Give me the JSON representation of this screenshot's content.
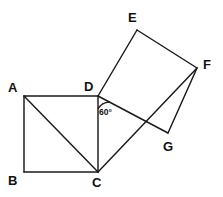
{
  "figure": {
    "name": "two-squares-geometry-diagram",
    "width": 223,
    "height": 197,
    "background_color": "#ffffff",
    "stroke_color": "#1a1a1a"
  },
  "vertices": [
    {
      "id": "A",
      "label": "A",
      "x": 24,
      "y": 96,
      "label_x": 8,
      "label_y": 81
    },
    {
      "id": "B",
      "label": "B",
      "x": 24,
      "y": 172,
      "label_x": 8,
      "label_y": 174
    },
    {
      "id": "C",
      "label": "C",
      "x": 98,
      "y": 172,
      "label_x": 92,
      "label_y": 176
    },
    {
      "id": "D",
      "label": "D",
      "x": 98,
      "y": 96,
      "label_x": 84,
      "label_y": 80
    },
    {
      "id": "E",
      "label": "E",
      "x": 137,
      "y": 30,
      "label_x": 128,
      "label_y": 11
    },
    {
      "id": "F",
      "label": "F",
      "x": 197,
      "y": 68,
      "label_x": 203,
      "label_y": 58
    },
    {
      "id": "G",
      "label": "G",
      "x": 168,
      "y": 133,
      "label_x": 163,
      "label_y": 140
    }
  ],
  "edges": [
    {
      "name": "edge-A-B",
      "from": "A",
      "to": "B"
    },
    {
      "name": "edge-B-C",
      "from": "B",
      "to": "C"
    },
    {
      "name": "edge-C-D",
      "from": "C",
      "to": "D"
    },
    {
      "name": "edge-D-A",
      "from": "D",
      "to": "A"
    },
    {
      "name": "diagonal-A-C",
      "from": "A",
      "to": "C"
    },
    {
      "name": "edge-D-E",
      "from": "D",
      "to": "E"
    },
    {
      "name": "edge-E-F",
      "from": "E",
      "to": "F"
    },
    {
      "name": "edge-F-G",
      "from": "F",
      "to": "G"
    },
    {
      "name": "edge-G-D",
      "from": "G",
      "to": "D"
    },
    {
      "name": "segment-C-F",
      "from": "C",
      "to": "F"
    }
  ],
  "angle_markers": [
    {
      "name": "angle-60-at-D",
      "label": "60°",
      "value": 60,
      "unit": "degrees",
      "at_vertex": "D",
      "label_x": 99,
      "label_y": 108,
      "arc_radius": 13
    }
  ]
}
